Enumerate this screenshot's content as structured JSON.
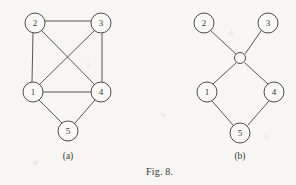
{
  "figure": {
    "caption": "Fig. 8.",
    "caption_x": 146,
    "caption_y": 175,
    "background_color": "#f7f6f3",
    "ink_color": "#585654"
  },
  "panels": [
    {
      "id": "panel-a",
      "sublabel": "(a)",
      "sublabel_x": 68,
      "sublabel_y": 159,
      "nodes": [
        {
          "id": "a-2",
          "label": "2",
          "cx": 35,
          "cy": 23,
          "r": 10
        },
        {
          "id": "a-3",
          "label": "3",
          "cx": 101,
          "cy": 23,
          "r": 10
        },
        {
          "id": "a-1",
          "label": "1",
          "cx": 33,
          "cy": 92,
          "r": 10
        },
        {
          "id": "a-4",
          "label": "4",
          "cx": 101,
          "cy": 92,
          "r": 10
        },
        {
          "id": "a-5",
          "label": "5",
          "cx": 68,
          "cy": 131,
          "r": 10
        }
      ],
      "edges": [
        {
          "id": "a-e-2-3",
          "from": "2",
          "to": "3",
          "x1": 45,
          "y1": 21,
          "x2": 91,
          "y2": 21
        },
        {
          "id": "a-e-2-1",
          "from": "2",
          "to": "1",
          "x1": 33,
          "y1": 33,
          "x2": 32,
          "y2": 82
        },
        {
          "id": "a-e-3-4",
          "from": "3",
          "to": "4",
          "x1": 102,
          "y1": 33,
          "x2": 102,
          "y2": 82
        },
        {
          "id": "a-e-1-4",
          "from": "1",
          "to": "4",
          "x1": 43,
          "y1": 92,
          "x2": 91,
          "y2": 92
        },
        {
          "id": "a-e-2-4",
          "from": "2",
          "to": "4",
          "x1": 42,
          "y1": 31,
          "x2": 94,
          "y2": 84
        },
        {
          "id": "a-e-3-1",
          "from": "3",
          "to": "1",
          "x1": 94,
          "y1": 31,
          "x2": 40,
          "y2": 84
        },
        {
          "id": "a-e-1-5",
          "from": "1",
          "to": "5",
          "x1": 39,
          "y1": 100,
          "x2": 62,
          "y2": 123
        },
        {
          "id": "a-e-4-5",
          "from": "4",
          "to": "5",
          "x1": 95,
          "y1": 100,
          "x2": 75,
          "y2": 123
        }
      ]
    },
    {
      "id": "panel-b",
      "sublabel": "(b)",
      "sublabel_x": 240,
      "sublabel_y": 159,
      "nodes": [
        {
          "id": "b-2",
          "label": "2",
          "cx": 204,
          "cy": 23,
          "r": 10
        },
        {
          "id": "b-3",
          "label": "3",
          "cx": 268,
          "cy": 23,
          "r": 10
        },
        {
          "id": "b-hub",
          "label": "",
          "cx": 240,
          "cy": 58,
          "r": 5.5
        },
        {
          "id": "b-1",
          "label": "1",
          "cx": 207,
          "cy": 92,
          "r": 10
        },
        {
          "id": "b-4",
          "label": "4",
          "cx": 274,
          "cy": 92,
          "r": 10
        },
        {
          "id": "b-5",
          "label": "5",
          "cx": 240,
          "cy": 133,
          "r": 10
        }
      ],
      "edges": [
        {
          "id": "b-e-2-hub",
          "from": "2",
          "to": "hub",
          "x1": 211,
          "y1": 31,
          "x2": 236,
          "y2": 54
        },
        {
          "id": "b-e-3-hub",
          "from": "3",
          "to": "hub",
          "x1": 261,
          "y1": 31,
          "x2": 245,
          "y2": 54
        },
        {
          "id": "b-e-hub-1",
          "from": "hub",
          "to": "1",
          "x1": 236,
          "y1": 63,
          "x2": 213,
          "y2": 84
        },
        {
          "id": "b-e-hub-4",
          "from": "hub",
          "to": "4",
          "x1": 245,
          "y1": 63,
          "x2": 268,
          "y2": 84
        },
        {
          "id": "b-e-1-5",
          "from": "1",
          "to": "5",
          "x1": 212,
          "y1": 101,
          "x2": 233,
          "y2": 125
        },
        {
          "id": "b-e-4-5",
          "from": "4",
          "to": "5",
          "x1": 269,
          "y1": 101,
          "x2": 248,
          "y2": 125
        }
      ]
    }
  ]
}
